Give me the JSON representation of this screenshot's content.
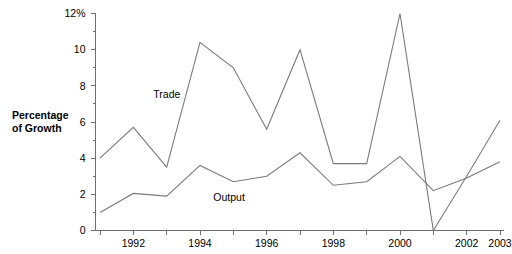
{
  "chart_data": {
    "type": "line",
    "title": "",
    "subtitle": "",
    "xlabel": "",
    "ylabel": "Percentage of Growth",
    "ylabel_lines": [
      "Percentage",
      "of Growth"
    ],
    "x": [
      1991,
      1992,
      1993,
      1994,
      1995,
      1996,
      1997,
      1998,
      1999,
      2000,
      2001,
      2002,
      2003
    ],
    "xlim": [
      1991,
      2003
    ],
    "ylim": [
      0,
      12
    ],
    "grid": false,
    "legend_position": "inline-annotation",
    "y_ticks": [
      0,
      2,
      4,
      6,
      8,
      10,
      12
    ],
    "y_tick_labels": [
      "0",
      "2",
      "4",
      "6",
      "8",
      "10",
      "12%"
    ],
    "y_minor_ticks": [
      1,
      3,
      5,
      7,
      9,
      11
    ],
    "x_ticks": [
      1991,
      1992,
      1993,
      1994,
      1995,
      1996,
      1997,
      1998,
      1999,
      2000,
      2001,
      2002,
      2003
    ],
    "x_tick_labels": [
      {
        "value": 1992,
        "label": "1992"
      },
      {
        "value": 1994,
        "label": "1994"
      },
      {
        "value": 1996,
        "label": "1996"
      },
      {
        "value": 1998,
        "label": "1998"
      },
      {
        "value": 2000,
        "label": "2000"
      },
      {
        "value": 2002,
        "label": "2002"
      },
      {
        "value": 2003,
        "label": "2003"
      }
    ],
    "series": [
      {
        "name": "Trade",
        "color": "#7a7a7a",
        "annotation_label": "Trade",
        "values": [
          4.0,
          5.7,
          3.5,
          10.4,
          9.0,
          5.6,
          10.0,
          3.7,
          3.7,
          12.0,
          0.0,
          3.0,
          6.1
        ]
      },
      {
        "name": "Output",
        "color": "#7a7a7a",
        "annotation_label": "Output",
        "values": [
          1.0,
          2.05,
          1.9,
          3.6,
          2.7,
          3.0,
          4.3,
          2.5,
          2.7,
          4.1,
          2.2,
          2.9,
          3.8
        ]
      }
    ],
    "annotations": [
      {
        "text": "Trade",
        "x": 1992.6,
        "y": 7.55
      },
      {
        "text": "Output",
        "x": 1994.4,
        "y": 1.85
      }
    ]
  }
}
